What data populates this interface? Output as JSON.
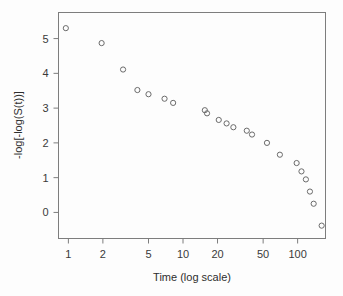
{
  "chart_data": {
    "type": "scatter",
    "title": "",
    "xlabel": "Time (log scale)",
    "ylabel": "-log[-log(S(t))]",
    "xscale": "log",
    "yscale": "linear",
    "xlim": [
      0.82,
      175
    ],
    "ylim": [
      -0.75,
      5.75
    ],
    "grid": false,
    "legend": null,
    "xticks": [
      1,
      2,
      5,
      10,
      20,
      50,
      100
    ],
    "xticklabels": [
      "1",
      "2",
      "5",
      "10",
      "20",
      "50",
      "100"
    ],
    "yticks": [
      0,
      1,
      2,
      3,
      4,
      5
    ],
    "yticklabels": [
      "0",
      "1",
      "2",
      "3",
      "4",
      "5"
    ],
    "marker": "open-circle",
    "marker_color": "#6b6b6b",
    "x": [
      0.95,
      1.95,
      3.0,
      4.0,
      5.0,
      6.9,
      8.2,
      15.5,
      16.2,
      20.5,
      24.0,
      27.5,
      36.0,
      40.0,
      54.0,
      70.0,
      98.0,
      108.0,
      118.0,
      128.0,
      138.0,
      162.0
    ],
    "y": [
      5.3,
      4.87,
      4.11,
      3.52,
      3.4,
      3.27,
      3.15,
      2.94,
      2.85,
      2.66,
      2.56,
      2.45,
      2.35,
      2.24,
      2.0,
      1.66,
      1.42,
      1.18,
      0.95,
      0.6,
      0.25,
      -0.38
    ],
    "points": [
      {
        "x": 0.95,
        "y": 5.3
      },
      {
        "x": 1.95,
        "y": 4.87
      },
      {
        "x": 3.0,
        "y": 4.11
      },
      {
        "x": 4.0,
        "y": 3.52
      },
      {
        "x": 5.0,
        "y": 3.4
      },
      {
        "x": 6.9,
        "y": 3.27
      },
      {
        "x": 8.2,
        "y": 3.15
      },
      {
        "x": 15.5,
        "y": 2.94
      },
      {
        "x": 16.2,
        "y": 2.85
      },
      {
        "x": 20.5,
        "y": 2.66
      },
      {
        "x": 24.0,
        "y": 2.56
      },
      {
        "x": 27.5,
        "y": 2.45
      },
      {
        "x": 36.0,
        "y": 2.35
      },
      {
        "x": 40.0,
        "y": 2.24
      },
      {
        "x": 54.0,
        "y": 2.0
      },
      {
        "x": 70.0,
        "y": 1.66
      },
      {
        "x": 98.0,
        "y": 1.42
      },
      {
        "x": 108.0,
        "y": 1.18
      },
      {
        "x": 118.0,
        "y": 0.95
      },
      {
        "x": 128.0,
        "y": 0.6
      },
      {
        "x": 138.0,
        "y": 0.25
      },
      {
        "x": 162.0,
        "y": -0.38
      }
    ]
  }
}
